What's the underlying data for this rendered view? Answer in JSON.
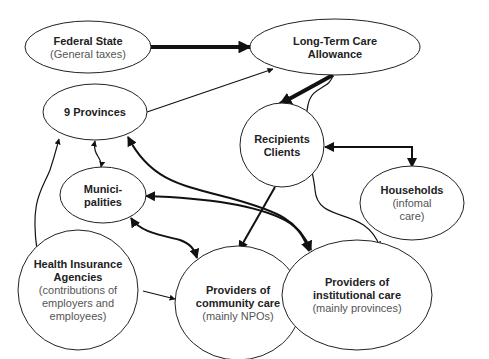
{
  "diagram": {
    "nodes": [
      {
        "id": "federal",
        "title": [
          "Federal State"
        ],
        "subtitle": [
          "(General taxes)"
        ]
      },
      {
        "id": "ltc",
        "title": [
          "Long-Term Care",
          "Allowance"
        ],
        "subtitle": []
      },
      {
        "id": "provinces",
        "title": [
          "9 Provinces"
        ],
        "subtitle": []
      },
      {
        "id": "recipients",
        "title": [
          "Recipients",
          "Clients"
        ],
        "subtitle": []
      },
      {
        "id": "municipalities",
        "title": [
          "Munici-",
          "palities"
        ],
        "subtitle": []
      },
      {
        "id": "households",
        "title": [
          "Households"
        ],
        "subtitle": [
          "(infomal",
          "care)"
        ]
      },
      {
        "id": "health",
        "title": [
          "Health Insurance",
          "Agencies"
        ],
        "subtitle": [
          "(contributions of",
          "employers and",
          "employees)"
        ]
      },
      {
        "id": "community",
        "title": [
          "Providers of",
          "community care"
        ],
        "subtitle": [
          "(mainly NPOs)"
        ]
      },
      {
        "id": "institutional",
        "title": [
          "Providers of",
          "institutional care"
        ],
        "subtitle": [
          "(mainly provinces)"
        ]
      }
    ],
    "edges": [
      {
        "id": "federal-to-ltc",
        "from": "federal",
        "to": "ltc",
        "style": "thick",
        "direction": "forward"
      },
      {
        "id": "provinces-to-ltc",
        "from": "provinces",
        "to": "ltc",
        "style": "thin",
        "direction": "forward"
      },
      {
        "id": "ltc-to-recipients",
        "from": "ltc",
        "to": "recipients",
        "style": "thick",
        "direction": "forward"
      },
      {
        "id": "ltc-to-institutional",
        "from": "ltc",
        "to": "institutional",
        "style": "thin",
        "direction": "forward"
      },
      {
        "id": "recipients-households",
        "from": "recipients",
        "to": "households",
        "style": "medium",
        "direction": "both"
      },
      {
        "id": "recipients-to-community",
        "from": "recipients",
        "to": "community",
        "style": "medium",
        "direction": "forward"
      },
      {
        "id": "provinces-municipalities",
        "from": "provinces",
        "to": "municipalities",
        "style": "thin",
        "direction": "both"
      },
      {
        "id": "provinces-institutional",
        "from": "provinces",
        "to": "institutional",
        "style": "medium",
        "direction": "both"
      },
      {
        "id": "municipalities-institutional",
        "from": "municipalities",
        "to": "institutional",
        "style": "medium",
        "direction": "both"
      },
      {
        "id": "municipalities-community",
        "from": "municipalities",
        "to": "community",
        "style": "medium",
        "direction": "both"
      },
      {
        "id": "health-to-provinces",
        "from": "health",
        "to": "provinces",
        "style": "thin",
        "direction": "forward"
      },
      {
        "id": "health-to-community",
        "from": "health",
        "to": "community",
        "style": "thin",
        "direction": "forward"
      }
    ]
  }
}
